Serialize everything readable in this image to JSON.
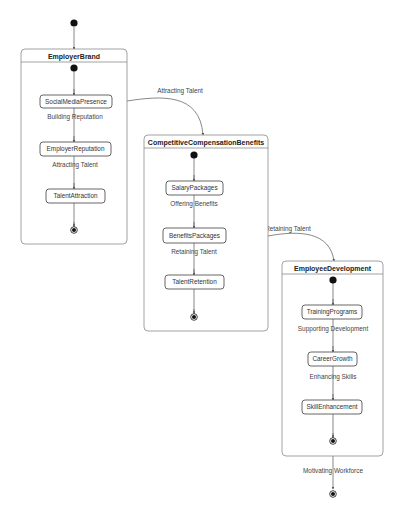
{
  "diagram": {
    "type": "state-machine",
    "colors": {
      "border": "#8a8a8a",
      "state_border": "#555555",
      "text": "#333333",
      "dot": "#111111"
    },
    "top_initial": {
      "x": 74,
      "y": 23
    },
    "composites": [
      {
        "id": "employer-brand",
        "title": "EmployerBrand",
        "box": {
          "x": 21,
          "y": 49,
          "w": 106,
          "h": 195
        },
        "initial": {
          "x": 74,
          "y": 68
        },
        "states": [
          {
            "name": "SocialMediaPresence",
            "x": 40,
            "y": 95,
            "w": 72,
            "h": 13
          },
          {
            "name": "EmployerReputation",
            "x": 40,
            "y": 142,
            "w": 71,
            "h": 14
          },
          {
            "name": "TalentAttraction",
            "x": 46,
            "y": 189,
            "w": 59,
            "h": 14
          }
        ],
        "inner_labels": [
          {
            "text": "Building Reputation",
            "x": 75,
            "y": 119
          },
          {
            "text": "Attracting Talent",
            "x": 75,
            "y": 167
          }
        ],
        "final": {
          "x": 74,
          "y": 230
        }
      },
      {
        "id": "competitive-compensation-benefits",
        "title": "CompetitiveCompensationBenefits",
        "box": {
          "x": 144,
          "y": 135,
          "w": 124,
          "h": 196
        },
        "initial": {
          "x": 194,
          "y": 155
        },
        "states": [
          {
            "name": "SalaryPackages",
            "x": 166,
            "y": 181,
            "w": 57,
            "h": 14
          },
          {
            "name": "BenefitsPackages",
            "x": 163,
            "y": 228,
            "w": 63,
            "h": 15
          },
          {
            "name": "TalentRetention",
            "x": 165,
            "y": 275,
            "w": 59,
            "h": 14
          }
        ],
        "inner_labels": [
          {
            "text": "Offering Benefits",
            "x": 194,
            "y": 206
          },
          {
            "text": "Retaining Talent",
            "x": 194,
            "y": 254
          }
        ],
        "final": {
          "x": 194,
          "y": 317
        }
      },
      {
        "id": "employee-development",
        "title": "EmployeeDevelopment",
        "box": {
          "x": 282,
          "y": 261,
          "w": 101,
          "h": 195
        },
        "initial": {
          "x": 333,
          "y": 280
        },
        "states": [
          {
            "name": "TrainingPrograms",
            "x": 302,
            "y": 305,
            "w": 60,
            "h": 14
          },
          {
            "name": "CareerGrowth",
            "x": 308,
            "y": 352,
            "w": 49,
            "h": 14
          },
          {
            "name": "SkillEnhancement",
            "x": 302,
            "y": 400,
            "w": 60,
            "h": 14
          }
        ],
        "inner_labels": [
          {
            "text": "Supporting Development",
            "x": 333,
            "y": 331
          },
          {
            "text": "Enhancing Skills",
            "x": 333,
            "y": 379
          }
        ],
        "final": {
          "x": 333,
          "y": 441
        }
      }
    ],
    "transitions": [
      {
        "label": "Attracting Talent",
        "label_x": 180,
        "label_y": 93,
        "path": "M127,101 C160,96 200,92 203,135"
      },
      {
        "label": "Retaining Talent",
        "label_x": 288,
        "label_y": 231,
        "path": "M268,236 C300,230 330,232 334,261"
      },
      {
        "label": "Motivating Workforce",
        "label_x": 333,
        "label_y": 473,
        "path": "M333,456 L333,489"
      }
    ],
    "bottom_final": {
      "x": 333,
      "y": 494
    }
  }
}
